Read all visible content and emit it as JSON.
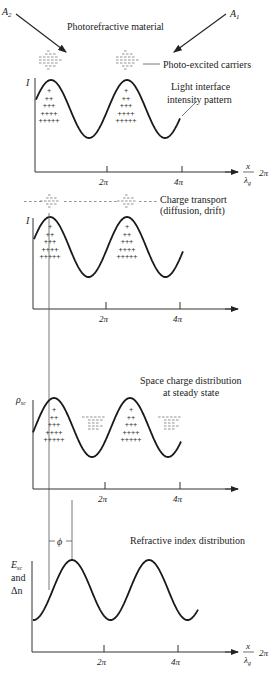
{
  "figure": {
    "beam_labels": {
      "a2": "A",
      "a2_sub": "2",
      "a1": "A",
      "a1_sub": "1"
    },
    "panels": [
      {
        "id": "intensity",
        "ylabel": "I",
        "annotations": [
          "Photorefractive material",
          "Photo-excited carriers",
          "Light interface",
          "intensity pattern"
        ],
        "ticks": [
          "2π",
          "4π"
        ],
        "xlabel_num": "x",
        "xlabel_den": "λ",
        "xlabel_den_sub": "g",
        "xlabel_suffix": "2π"
      },
      {
        "id": "transport",
        "ylabel": "I",
        "annotations": [
          "Charge transport",
          "(diffusion, drift)"
        ],
        "ticks": [
          "2π",
          "4π"
        ]
      },
      {
        "id": "space-charge",
        "ylabel": "ρ",
        "ylabel_sub": "sc",
        "annotations": [
          "Space charge distribution",
          "at steady state"
        ],
        "ticks": [
          "2π",
          "4π"
        ]
      },
      {
        "id": "refractive-index",
        "ylabel_lines": [
          "E",
          "and",
          "Δn"
        ],
        "ylabel_sub": "sc",
        "annotations": [
          "Refractive index distribution"
        ],
        "phase_label": "ϕ",
        "ticks": [
          "2π",
          "4π"
        ],
        "xlabel_num": "x",
        "xlabel_den": "λ",
        "xlabel_den_sub": "g",
        "xlabel_suffix": "2π"
      }
    ]
  },
  "chart_data": {
    "type": "line",
    "title": "",
    "xlabel": "x/λg 2π",
    "x_ticks": [
      "2π",
      "4π"
    ],
    "series": [
      {
        "name": "I (light intensity)",
        "function": "sinusoid",
        "periods_shown": 2.2,
        "phase_offset_rad": 0
      },
      {
        "name": "I (after charge transport)",
        "function": "sinusoid",
        "periods_shown": 2.2,
        "phase_offset_rad": 0
      },
      {
        "name": "ρsc (space charge)",
        "function": "sinusoid",
        "periods_shown": 2.2,
        "phase_offset_rad": 0
      },
      {
        "name": "Esc and Δn",
        "function": "sinusoid",
        "periods_shown": 2.2,
        "phase_offset_label": "ϕ"
      }
    ]
  }
}
